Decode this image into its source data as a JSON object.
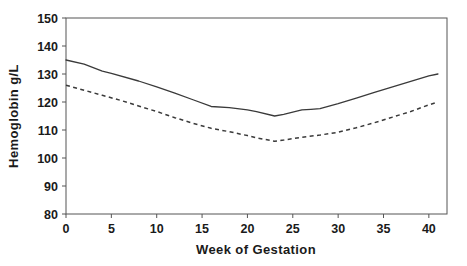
{
  "chart_data": {
    "type": "line",
    "title": "",
    "xlabel": "Week of Gestation",
    "ylabel": "Hemoglobin g/L",
    "xlim": [
      0,
      42
    ],
    "ylim": [
      80,
      150
    ],
    "xticks": [
      0,
      5,
      10,
      15,
      20,
      25,
      30,
      35,
      40
    ],
    "yticks": [
      80,
      90,
      100,
      110,
      120,
      130,
      140,
      150
    ],
    "xtick_labels": [
      "0",
      "5",
      "10",
      "15",
      "20",
      "25",
      "30",
      "35",
      "40"
    ],
    "ytick_labels": [
      "80",
      "90",
      "100",
      "110",
      "120",
      "130",
      "140",
      "150"
    ],
    "grid": false,
    "legend": "none",
    "frame": "full-box",
    "series": [
      {
        "name": "upper-solid-curve",
        "style": "solid",
        "color": "#3a3a3a",
        "x": [
          0,
          2,
          4,
          5,
          8,
          10,
          12,
          14,
          16,
          18,
          20,
          21,
          23,
          24,
          26,
          27,
          28,
          30,
          32,
          34,
          36,
          38,
          40,
          41
        ],
        "y": [
          135.0,
          133.5,
          131.0,
          130.2,
          127.5,
          125.4,
          123.2,
          120.8,
          118.4,
          118.0,
          117.2,
          116.6,
          115.0,
          115.6,
          117.2,
          117.4,
          117.6,
          119.4,
          121.4,
          123.4,
          125.4,
          127.4,
          129.3,
          130.0
        ]
      },
      {
        "name": "lower-dashed-curve",
        "style": "dashed",
        "color": "#3a3a3a",
        "x": [
          0,
          2,
          4,
          6,
          8,
          10,
          12,
          14,
          16,
          18,
          20,
          21,
          23,
          24,
          26,
          28,
          30,
          32,
          34,
          36,
          38,
          40,
          41
        ],
        "y": [
          126.0,
          124.2,
          122.4,
          120.6,
          118.6,
          116.6,
          114.4,
          112.4,
          110.6,
          109.4,
          108.0,
          107.2,
          106.0,
          106.4,
          107.4,
          108.2,
          109.2,
          110.8,
          112.6,
          114.6,
          116.6,
          119.0,
          120.0
        ]
      }
    ]
  }
}
